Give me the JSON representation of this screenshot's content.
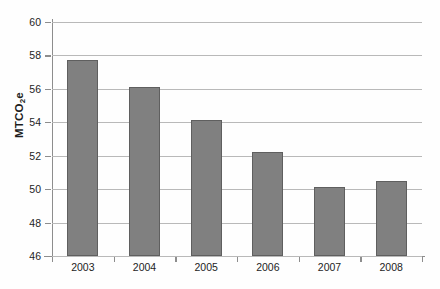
{
  "chart_data": {
    "type": "bar",
    "title": "",
    "subtitle": "",
    "xlabel": "",
    "ylabel": "MTCO2e",
    "ylabel_parts": {
      "pre": "MTCO",
      "sub": "2",
      "post": "e"
    },
    "categories": [
      "2003",
      "2004",
      "2005",
      "2006",
      "2007",
      "2008"
    ],
    "values": [
      57.7,
      56.1,
      54.15,
      52.25,
      50.1,
      50.5
    ],
    "series": [
      {
        "name": "",
        "values": [
          57.7,
          56.1,
          54.15,
          52.25,
          50.1,
          50.5
        ]
      }
    ],
    "ylim": [
      46,
      60
    ],
    "ytick_labels": [
      "46",
      "48",
      "50",
      "52",
      "54",
      "56",
      "58",
      "60"
    ],
    "ytick_values": [
      46,
      48,
      50,
      52,
      54,
      56,
      58,
      60
    ],
    "ytick_interval": 2,
    "grid": "horizontal",
    "legend": "none",
    "legend_entries": [],
    "annotations": [],
    "bar_color": "#808080",
    "bar_edge_color": "#5f5f5f",
    "gridline_color": "#b9b9b9",
    "axis_color": "#8d8d8d",
    "text_color": "#1d1d1d",
    "background_color": "#fefefe"
  }
}
